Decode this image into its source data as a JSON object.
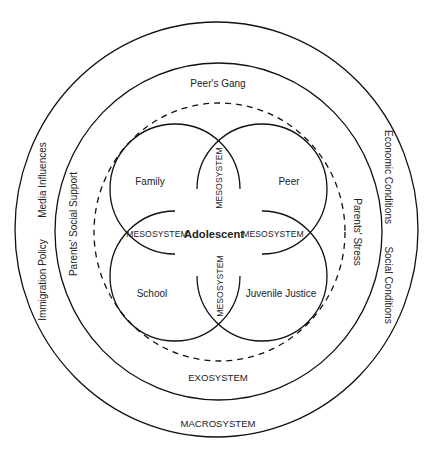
{
  "diagram": {
    "type": "ecological-systems-model",
    "center": {
      "label": "Adolescent"
    },
    "microsystems": [
      {
        "id": "family",
        "label": "Family"
      },
      {
        "id": "peer",
        "label": "Peer"
      },
      {
        "id": "school",
        "label": "School"
      },
      {
        "id": "juvenile-justice",
        "label": "Juvenile Justice"
      }
    ],
    "mesosystem": {
      "label": "MESOSYSTEM",
      "labels": [
        "MESOSYSTEM",
        "MESOSYSTEM",
        "MESOSYSTEM",
        "MESOSYSTEM"
      ]
    },
    "exosystem": {
      "label": "EXOSYSTEM",
      "items": [
        "Peer's Gang",
        "Parents' Social Support",
        "Parents' Stress"
      ]
    },
    "macrosystem": {
      "label": "MACROSYSTEM",
      "items": [
        "Media Influences",
        "Immigration Policy",
        "Economic Conditions",
        "Social Conditions"
      ]
    }
  }
}
